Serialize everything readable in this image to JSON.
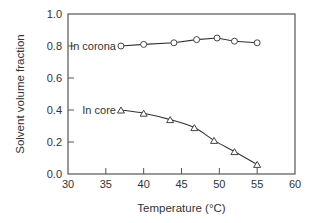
{
  "chart_data": {
    "type": "line",
    "title": "",
    "xlabel": "Temperature (°C)",
    "ylabel": "Solvent volume fraction",
    "xlim": [
      30,
      60
    ],
    "ylim": [
      0.0,
      1.0
    ],
    "xticks": [
      "30",
      "35",
      "40",
      "45",
      "50",
      "55",
      "60"
    ],
    "yticks": [
      "0.0",
      "0.2",
      "0.4",
      "0.6",
      "0.8",
      "1.0"
    ],
    "grid": false,
    "legend": "inline labels at left of each series",
    "series": [
      {
        "name": "In corona",
        "marker": "circle",
        "x": [
          37,
          40,
          44,
          47,
          49.7,
          52,
          55
        ],
        "y": [
          0.8,
          0.81,
          0.82,
          0.84,
          0.85,
          0.83,
          0.82
        ]
      },
      {
        "name": "In core",
        "marker": "triangle",
        "x": [
          37,
          40,
          43.5,
          46.7,
          49.3,
          52,
          55
        ],
        "y": [
          0.4,
          0.38,
          0.34,
          0.29,
          0.21,
          0.14,
          0.06
        ]
      }
    ]
  }
}
